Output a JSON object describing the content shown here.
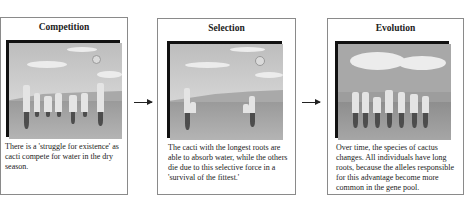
{
  "panels": [
    {
      "title": "Competition",
      "caption": "There is a 'struggle for existence' as cacti compete for water in the dry season.",
      "image": "cacti-competing-grayscale-scene"
    },
    {
      "title": "Selection",
      "caption": "The cacti with the longest roots are able to absorb water, while the others die due to this selective force in a 'survival of the fittest.'",
      "image": "surviving-long-root-cacti-scene"
    },
    {
      "title": "Evolution",
      "caption": "Over time, the species of cactus changes. All individuals have long roots, because the alleles responsible for this advantage become more common in the gene pool.",
      "image": "evolved-long-root-cacti-scene"
    }
  ],
  "arrows": [
    "arrow-right-icon",
    "arrow-right-icon"
  ],
  "colors": {
    "border": "#8a8a8a",
    "frame": "#111111",
    "text": "#222222"
  }
}
